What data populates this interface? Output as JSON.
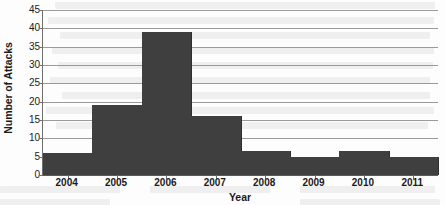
{
  "chart_data": {
    "type": "bar",
    "title": "",
    "subtitle": "",
    "xlabel": "Year",
    "ylabel": "Number of Attacks",
    "categories": [
      "2004",
      "2005",
      "2006",
      "2007",
      "2008",
      "2009",
      "2010",
      "2011"
    ],
    "values": [
      6,
      19,
      39,
      16,
      6.5,
      5,
      6.5,
      5
    ],
    "series": [
      {
        "name": "Number of Attacks",
        "values": [
          6,
          19,
          39,
          16,
          6.5,
          5,
          6.5,
          5
        ]
      }
    ],
    "ylim": [
      0,
      45
    ],
    "yticks": [
      0,
      5,
      10,
      15,
      20,
      25,
      30,
      35,
      40,
      45
    ],
    "ytick_labels": [
      "0",
      "5",
      "10",
      "15",
      "20",
      "25",
      "30",
      "35",
      "40",
      "45"
    ],
    "xtick_labels": [
      "2004",
      "2005",
      "2006",
      "2007",
      "2008",
      "2009",
      "2010",
      "2011"
    ],
    "grid": true,
    "grid_axis": "y",
    "legend": false,
    "legend_position": "none",
    "bar_style": "histogram-contiguous",
    "bar_gap": 0,
    "colors": {
      "bar_fill": "#3f3f3f",
      "gridline": "#9a9a9a",
      "axis": "#6f6f6f",
      "text": "#1a1a1a",
      "background": "#fdfdfd"
    },
    "annotations": []
  },
  "figure": {
    "ylabel": "Number of Attacks",
    "xlabel": "Year"
  }
}
